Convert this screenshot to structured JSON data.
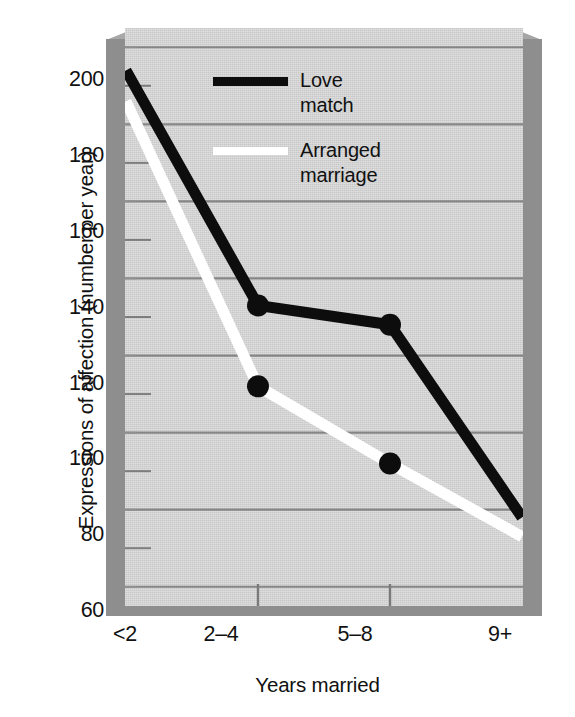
{
  "chart_data": {
    "type": "line",
    "title": "",
    "xlabel": "Years married",
    "ylabel": "Expressions of affection (number per year)",
    "categories": [
      "<2",
      "2–4",
      "5–8",
      "9+"
    ],
    "ylim": [
      55,
      205
    ],
    "yticks": [
      60,
      80,
      100,
      120,
      140,
      160,
      180,
      200
    ],
    "ytick_labels": [
      "60",
      "80",
      "100",
      "120",
      "140",
      "160",
      "180",
      "200"
    ],
    "minor_yticks": [
      70,
      90,
      110,
      130,
      150,
      170,
      190
    ],
    "grid": "horizontal-major-and-minor",
    "legend_position": "top-right-inside",
    "series": [
      {
        "name": "Love match",
        "label": "Love\nmatch",
        "color": "#0d0d0d",
        "marker": "filled-circle",
        "values": [
          194,
          133,
          128,
          78
        ]
      },
      {
        "name": "Arranged marriage",
        "label": "Arranged\nmarriage",
        "color": "#ffffff",
        "marker": "filled-circle",
        "values": [
          186,
          112,
          92,
          73
        ]
      }
    ]
  },
  "axes": {
    "y_title": "Expressions of affection (number per year)",
    "x_title": "Years married",
    "y_tick_labels": [
      "200",
      "180",
      "160",
      "140",
      "120",
      "100",
      "80",
      "60"
    ],
    "x_tick_labels": [
      "<2",
      "2–4",
      "5–8",
      "9+"
    ]
  },
  "legend": {
    "items": [
      {
        "label": "Love\nmatch",
        "color": "#0d0d0d"
      },
      {
        "label": "Arranged\nmarriage",
        "color": "#ffffff"
      }
    ]
  },
  "colors": {
    "plot_background": "#c8c8c8",
    "box_shadow": "#8e8e8e",
    "gridline": "#8a8a8a",
    "series_love_match": "#0d0d0d",
    "series_arranged_marriage": "#ffffff",
    "text": "#111111",
    "page_background": "#ffffff"
  }
}
